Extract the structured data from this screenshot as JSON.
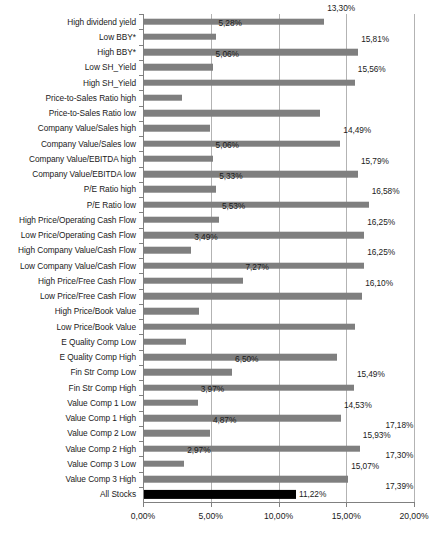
{
  "chart_data": {
    "type": "bar",
    "orientation": "horizontal",
    "title": "",
    "xlabel": "",
    "ylabel": "",
    "xlim": [
      0,
      20
    ],
    "xticks": [
      "0,00%",
      "5,00%",
      "10,00%",
      "15,00%",
      "20,00%"
    ],
    "xtick_values": [
      0,
      5,
      10,
      15,
      20
    ],
    "grid": true,
    "grid_axis": "x",
    "legend": null,
    "decimal_separator": ",",
    "bar_color": "#7f7f7f",
    "highlight_color": "#000000",
    "categories": [
      "High dividend yield",
      "Low BBY*",
      "High BBY*",
      "Low SH_Yield",
      "High SH_Yield",
      "Price-to-Sales Ratio high",
      "Price-to-Sales Ratio low",
      "Company Value/Sales high",
      "Company Value/Sales low",
      "Company Value/EBITDA high",
      "Company Value/EBITDA low",
      "P/E Ratio high",
      "P/E Ratio low",
      "High Price/Operating Cash Flow",
      "Low Price/Operating Cash Flow",
      "High Company Value/Cash Flow",
      "Low Company Value/Cash Flow",
      "High Price/Free Cash Flow",
      "Low Price/Free Cash Flow",
      "High Price/Book Value",
      "Low Price/Book Value",
      "E Quality Comp Low",
      "E Quality Comp High",
      "Fin Str Comp Low",
      "Fin Str Comp High",
      "Value Comp 1 Low",
      "Value Comp 1 High",
      "Value Comp 2 Low",
      "Value Comp 2 High",
      "Value Comp 3 Low",
      "Value Comp 3 High",
      "All Stocks"
    ],
    "values": [
      13.3,
      5.28,
      15.81,
      5.06,
      15.56,
      2.8,
      13.0,
      4.9,
      14.49,
      5.06,
      15.79,
      5.33,
      16.58,
      5.53,
      16.25,
      3.49,
      16.25,
      7.27,
      16.1,
      4.05,
      15.55,
      3.1,
      14.27,
      6.5,
      15.49,
      3.97,
      14.53,
      4.87,
      15.93,
      2.97,
      15.07,
      11.22
    ],
    "labels": [
      "13,30%",
      "5,28%",
      "15,81%",
      "5,06%",
      "15,56%",
      "",
      "",
      "",
      "14,49%",
      "5,06%",
      "15,79%",
      "5,33%",
      "16,58%",
      "5,53%",
      "16,25%",
      "3,49%",
      "16,25%",
      "7,27%",
      "16,10%",
      "",
      "",
      "",
      "",
      "6,50%",
      "15,49%",
      "3,97%",
      "14,53%",
      "4,87%",
      "15,93%",
      "2,97%",
      "15,07%",
      "11,22%"
    ],
    "extra_labels": [
      "17,18%",
      "17,30%",
      "17,39%"
    ],
    "highlight_index": 31
  }
}
